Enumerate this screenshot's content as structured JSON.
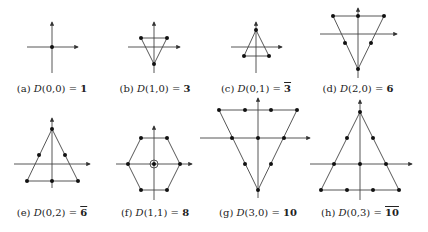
{
  "figure": {
    "panels": [
      {
        "id": "a",
        "tag": "(a)",
        "fn": "D",
        "args": "(0,0)",
        "eq": "=",
        "value": "1",
        "conj": false,
        "cx": 52,
        "label_y": 83
      },
      {
        "id": "b",
        "tag": "(b)",
        "fn": "D",
        "args": "(1,0)",
        "eq": "=",
        "value": "3",
        "conj": false,
        "cx": 155,
        "label_y": 83
      },
      {
        "id": "c",
        "tag": "(c)",
        "fn": "D",
        "args": "(0,1)",
        "eq": "=",
        "value": "3",
        "conj": true,
        "cx": 256,
        "label_y": 83
      },
      {
        "id": "d",
        "tag": "(d)",
        "fn": "D",
        "args": "(2,0)",
        "eq": "=",
        "value": "6",
        "conj": false,
        "cx": 358,
        "label_y": 83
      },
      {
        "id": "e",
        "tag": "(e)",
        "fn": "D",
        "args": "(0,2)",
        "eq": "=",
        "value": "6",
        "conj": true,
        "cx": 52,
        "label_y": 207
      },
      {
        "id": "f",
        "tag": "(f)",
        "fn": "D",
        "args": "(1,1)",
        "eq": "=",
        "value": "8",
        "conj": false,
        "cx": 155,
        "label_y": 207
      },
      {
        "id": "g",
        "tag": "(g)",
        "fn": "D",
        "args": "(3,0)",
        "eq": "=",
        "value": "10",
        "conj": false,
        "cx": 258,
        "label_y": 207
      },
      {
        "id": "h",
        "tag": "(h)",
        "fn": "D",
        "args": "(0,3)",
        "eq": "=",
        "value": "10",
        "conj": true,
        "cx": 360,
        "label_y": 207
      }
    ]
  }
}
